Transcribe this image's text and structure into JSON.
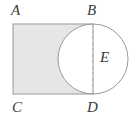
{
  "figure": {
    "kind": "geometry-diagram",
    "canvas": {
      "width": 136,
      "height": 125,
      "background": "#ffffff"
    },
    "colors": {
      "shading": "#e6e6e6",
      "stroke": "#9a9a9a",
      "circle_stroke": "#9a9a9a",
      "dashed_stroke": "#b0b0b0",
      "label_text": "#3b3b3b",
      "unshaded": "#ffffff"
    },
    "rectangle": {
      "name": "rectangle-ABDC",
      "x": 13,
      "y": 24,
      "width": 80,
      "height": 70,
      "fill": "#e6e6e6",
      "stroke_width": 1
    },
    "circle": {
      "name": "circle-E",
      "center_x": 93,
      "center_y": 59,
      "radius": 35,
      "fill": "#ffffff",
      "stroke_width": 1
    },
    "dashed_segment": {
      "name": "segment-BD",
      "x": 93,
      "y1": 24,
      "y2": 94,
      "dash": "3 3",
      "stroke_width": 1
    },
    "labels": [
      {
        "id": "A",
        "text": "A",
        "x": 11,
        "y": 3
      },
      {
        "id": "B",
        "text": "B",
        "x": 87,
        "y": 3
      },
      {
        "id": "E",
        "text": "E",
        "x": 100,
        "y": 50
      },
      {
        "id": "C",
        "text": "C",
        "x": 12,
        "y": 100
      },
      {
        "id": "D",
        "text": "D",
        "x": 87,
        "y": 100
      }
    ]
  }
}
